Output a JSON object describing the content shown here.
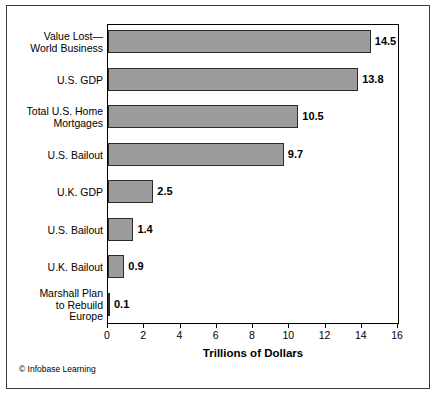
{
  "credit": "© Infobase Learning",
  "chart_data": {
    "type": "bar",
    "orientation": "horizontal",
    "title": "",
    "xlabel": "Trillions of Dollars",
    "ylabel": "",
    "xlim": [
      0,
      16
    ],
    "xticks": [
      0,
      2,
      4,
      6,
      8,
      10,
      12,
      14,
      16
    ],
    "xtick_labels": [
      "0",
      "2",
      "4",
      "6",
      "8",
      "10",
      "12",
      "14",
      "16"
    ],
    "grid": false,
    "legend": null,
    "bar_color": "#9c9c9c",
    "bar_edge_color": "#2b2b2b",
    "categories": [
      "Value Lost—\nWorld Business",
      "U.S. GDP",
      "Total U.S. Home\nMortgages",
      "U.S. Bailout",
      "U.K. GDP",
      "U.S. Bailout",
      "U.K. Bailout",
      "Marshall Plan\nto Rebuild\nEurope"
    ],
    "values": [
      14.5,
      13.8,
      10.5,
      9.7,
      2.5,
      1.4,
      0.9,
      0.1
    ],
    "value_labels": [
      "14.5",
      "13.8",
      "10.5",
      "9.7",
      "2.5",
      "1.4",
      "0.9",
      "0.1"
    ]
  }
}
